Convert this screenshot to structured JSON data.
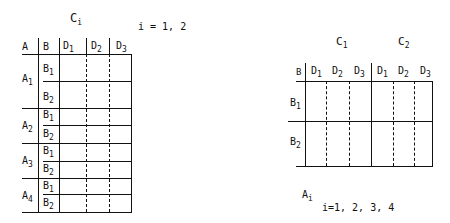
{
  "left_table": {
    "title": {
      "base": "C",
      "sub": "i"
    },
    "index_note": "i = 1, 2",
    "headers": {
      "a": "A",
      "b": "B",
      "d": [
        {
          "base": "D",
          "sub": "1"
        },
        {
          "base": "D",
          "sub": "2"
        },
        {
          "base": "D",
          "sub": "3"
        }
      ]
    },
    "rows": [
      {
        "a": {
          "base": "A",
          "sub": "1"
        },
        "b": [
          {
            "base": "B",
            "sub": "1"
          },
          {
            "base": "B",
            "sub": "2"
          }
        ]
      },
      {
        "a": {
          "base": "A",
          "sub": "2"
        },
        "b": [
          {
            "base": "B",
            "sub": "1"
          },
          {
            "base": "B",
            "sub": "2"
          }
        ]
      },
      {
        "a": {
          "base": "A",
          "sub": "3"
        },
        "b": [
          {
            "base": "B",
            "sub": "1"
          },
          {
            "base": "B",
            "sub": "2"
          }
        ]
      },
      {
        "a": {
          "base": "A",
          "sub": "4"
        },
        "b": [
          {
            "base": "B",
            "sub": "1"
          },
          {
            "base": "B",
            "sub": "2"
          }
        ]
      }
    ]
  },
  "right_table": {
    "groups": [
      {
        "base": "C",
        "sub": "1"
      },
      {
        "base": "C",
        "sub": "2"
      }
    ],
    "headers": {
      "b": "B",
      "d": [
        {
          "base": "D",
          "sub": "1"
        },
        {
          "base": "D",
          "sub": "2"
        },
        {
          "base": "D",
          "sub": "3"
        },
        {
          "base": "D",
          "sub": "1"
        },
        {
          "base": "D",
          "sub": "2"
        },
        {
          "base": "D",
          "sub": "3"
        }
      ]
    },
    "rows": [
      {
        "base": "B",
        "sub": "1"
      },
      {
        "base": "B",
        "sub": "2"
      }
    ],
    "caption": {
      "base": "A",
      "sub": "i"
    },
    "index_note": "i=1, 2, 3, 4"
  }
}
